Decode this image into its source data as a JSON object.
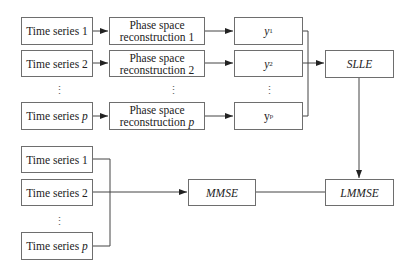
{
  "diagram": {
    "top": {
      "inputs": [
        {
          "label": "Time series 1"
        },
        {
          "label": "Time series 2"
        },
        {
          "label": "Time series",
          "var": "p"
        }
      ],
      "reconstructions": [
        {
          "line1": "Phase space",
          "line2": "reconstruction 1"
        },
        {
          "line1": "Phase space",
          "line2": "reconstruction 2"
        },
        {
          "line1": "Phase space",
          "line2": "reconstruction",
          "var": "p"
        }
      ],
      "outputs": [
        {
          "base": "y",
          "sub": "1"
        },
        {
          "base": "y",
          "sub": "2"
        },
        {
          "base": "y",
          "sub": "p"
        }
      ],
      "merge_node": "SLLE"
    },
    "bottom": {
      "inputs": [
        {
          "label": "Time series 1"
        },
        {
          "label": "Time series 2"
        },
        {
          "label": "Time series",
          "var": "p"
        }
      ],
      "estimator": "MMSE",
      "fusion_node": "LMMSE"
    },
    "ellipsis": "⋮"
  }
}
